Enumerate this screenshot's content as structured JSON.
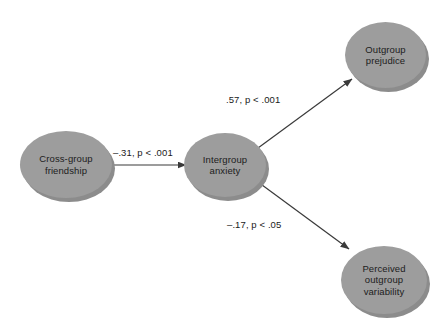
{
  "diagram": {
    "type": "path-model",
    "background_color": "#ffffff",
    "node_fill_color": "#9d9d9d",
    "node_shadow_color": "#8c8c8c",
    "text_color": "#1c1c1c",
    "edge_color": "#3a3a3a",
    "nodes": [
      {
        "id": "cross-group-friendship",
        "label": "Cross-group\nfriendship"
      },
      {
        "id": "intergroup-anxiety",
        "label": "Intergroup\nanxiety"
      },
      {
        "id": "outgroup-prejudice",
        "label": "Outgroup\nprejudice"
      },
      {
        "id": "perceived-outgroup-variability",
        "label": "Perceived\noutgroup\nvariability"
      }
    ],
    "edges": [
      {
        "id": "friendship-to-anxiety",
        "from": "cross-group-friendship",
        "to": "intergroup-anxiety",
        "label": "–.31, p < .001",
        "coefficient": -0.31,
        "p_text": "p < .001"
      },
      {
        "id": "anxiety-to-prejudice",
        "from": "intergroup-anxiety",
        "to": "outgroup-prejudice",
        "label": ".57, p < .001",
        "coefficient": 0.57,
        "p_text": "p < .001"
      },
      {
        "id": "anxiety-to-variability",
        "from": "intergroup-anxiety",
        "to": "perceived-outgroup-variability",
        "label": "–.17, p < .05",
        "coefficient": -0.17,
        "p_text": "p < .05"
      }
    ]
  }
}
